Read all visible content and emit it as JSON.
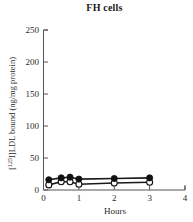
{
  "chart_data": {
    "type": "scatter",
    "title": "FH cells",
    "xlabel": "Hours",
    "ylabel": "[125I]LDL bound (ng/mg protein)",
    "ylabel_prefix": "[",
    "ylabel_sup": "125",
    "ylabel_suffix": "I]LDL bound (ng/mg protein)",
    "xlim": [
      0,
      4
    ],
    "ylim": [
      0,
      250
    ],
    "xticks": [
      0,
      1,
      2,
      3,
      4
    ],
    "xtick_labels": [
      "0",
      "1",
      "2",
      "3",
      "4"
    ],
    "yticks": [
      0,
      50,
      100,
      150,
      200,
      250
    ],
    "ytick_labels": [
      "0",
      "50",
      "100",
      "150",
      "200",
      "250"
    ],
    "grid": false,
    "legend": "none",
    "x": [
      0.15,
      0.5,
      0.75,
      1.0,
      2.0,
      3.0
    ],
    "series": [
      {
        "name": "filled-circles",
        "marker": "filled-circle",
        "values": [
          16,
          19,
          20,
          17,
          18,
          19
        ],
        "errors": [
          2,
          2,
          2,
          2,
          2,
          2
        ]
      },
      {
        "name": "open-circles",
        "marker": "open-circle",
        "values": [
          8,
          13,
          13,
          9,
          11,
          12
        ],
        "errors": [
          3,
          2,
          2,
          3,
          3,
          3
        ]
      }
    ]
  },
  "figure": {
    "title": "FH cells",
    "x_axis_label": "Hours",
    "y_axis_label": "[125I]LDL bound (ng/mg protein)"
  }
}
